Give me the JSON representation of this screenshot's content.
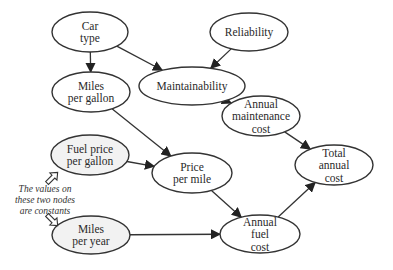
{
  "diagram": {
    "type": "influence-diagram",
    "nodes": [
      {
        "id": "car_type",
        "lines": [
          "Car",
          "type"
        ],
        "constant": false
      },
      {
        "id": "reliability",
        "lines": [
          "Reliability"
        ],
        "constant": false
      },
      {
        "id": "maintainability",
        "lines": [
          "Maintainability"
        ],
        "constant": false
      },
      {
        "id": "miles_per_gallon",
        "lines": [
          "Miles",
          "per gallon"
        ],
        "constant": false
      },
      {
        "id": "annual_maintenance_cost",
        "lines": [
          "Annual",
          "maintenance",
          "cost"
        ],
        "constant": false
      },
      {
        "id": "fuel_price_per_gallon",
        "lines": [
          "Fuel price",
          "per gallon"
        ],
        "constant": true
      },
      {
        "id": "price_per_mile",
        "lines": [
          "Price",
          "per mile"
        ],
        "constant": false
      },
      {
        "id": "total_annual_cost",
        "lines": [
          "Total",
          "annual",
          "cost"
        ],
        "constant": false
      },
      {
        "id": "miles_per_year",
        "lines": [
          "Miles",
          "per year"
        ],
        "constant": true
      },
      {
        "id": "annual_fuel_cost",
        "lines": [
          "Annual",
          "fuel",
          "cost"
        ],
        "constant": false
      }
    ],
    "edges": [
      {
        "from": "car_type",
        "to": "miles_per_gallon"
      },
      {
        "from": "car_type",
        "to": "maintainability"
      },
      {
        "from": "reliability",
        "to": "maintainability"
      },
      {
        "from": "maintainability",
        "to": "annual_maintenance_cost"
      },
      {
        "from": "miles_per_gallon",
        "to": "price_per_mile"
      },
      {
        "from": "fuel_price_per_gallon",
        "to": "price_per_mile"
      },
      {
        "from": "price_per_mile",
        "to": "annual_fuel_cost"
      },
      {
        "from": "miles_per_year",
        "to": "annual_fuel_cost"
      },
      {
        "from": "annual_maintenance_cost",
        "to": "total_annual_cost"
      },
      {
        "from": "annual_fuel_cost",
        "to": "total_annual_cost"
      }
    ],
    "annotation": {
      "lines": [
        "The values on",
        "these two nodes",
        "are constants"
      ],
      "points_to": [
        "fuel_price_per_gallon",
        "miles_per_year"
      ]
    },
    "colors": {
      "stroke": "#333333",
      "node_fill": "#ffffff",
      "constant_fill": "#f2f2f2",
      "text": "#2a2a2a"
    }
  }
}
